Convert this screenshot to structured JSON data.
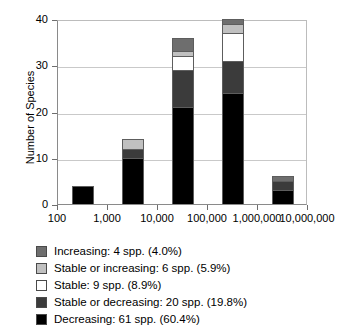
{
  "chart_data": {
    "type": "bar",
    "title": "",
    "subtitle": "",
    "xlabel": "",
    "ylabel": "Number of Species",
    "stacked": true,
    "grid": true,
    "legend_position": "below",
    "xscale": "log",
    "xlim": [
      100,
      10000000
    ],
    "ylim": [
      0,
      40
    ],
    "ytick_values": [
      0,
      10,
      20,
      30,
      40
    ],
    "ytick_labels": [
      "0",
      "10",
      "20",
      "30",
      "40"
    ],
    "xtick_values": [
      100,
      1000,
      10000,
      100000,
      1000000,
      10000000
    ],
    "xtick_labels": [
      "100",
      "1,000",
      "10,000",
      "100,000",
      "1,000,000",
      "10,000,000"
    ],
    "categories": [
      "100-1,000",
      "1,000-10,000",
      "10,000-100,000",
      "100,000-1,000,000",
      "1,000,000-10,000,000"
    ],
    "bar_totals": [
      4,
      14,
      36,
      40,
      6
    ],
    "series": [
      {
        "name": "Decreasing",
        "color": "#000000",
        "legend_label": "Decreasing: 61 spp. (60.4%)",
        "count": 61,
        "percent": "60.4%",
        "values": [
          4,
          10,
          21,
          24,
          3
        ]
      },
      {
        "name": "Stable or decreasing",
        "color": "#3b3b3b",
        "legend_label": "Stable or decreasing: 20 spp. (19.8%)",
        "count": 20,
        "percent": "19.8%",
        "values": [
          0,
          2,
          8,
          7,
          2
        ]
      },
      {
        "name": "Stable",
        "color": "#ffffff",
        "legend_label": "Stable: 9 spp. (8.9%)",
        "count": 9,
        "percent": "8.9%",
        "values": [
          0,
          0,
          3,
          6,
          0
        ]
      },
      {
        "name": "Stable or increasing",
        "color": "#c0c0c0",
        "legend_label": "Stable or increasing: 6 spp. (5.9%)",
        "count": 6,
        "percent": "5.9%",
        "values": [
          0,
          2,
          1,
          2,
          0
        ]
      },
      {
        "name": "Increasing",
        "color": "#6e6e6e",
        "legend_label": "Increasing: 4 spp. (4.0%)",
        "count": 4,
        "percent": "4.0%",
        "values": [
          0,
          0,
          3,
          1,
          1
        ]
      }
    ]
  },
  "axes": {
    "y_title": "Number of Species",
    "y_ticks": [
      {
        "label": "40"
      },
      {
        "label": "30"
      },
      {
        "label": "20"
      },
      {
        "label": "10"
      },
      {
        "label": "0"
      }
    ],
    "x_ticks": [
      {
        "label": "100"
      },
      {
        "label": "1,000"
      },
      {
        "label": "10,000"
      },
      {
        "label": "100,000"
      },
      {
        "label": "1,000,000"
      },
      {
        "label": "10,000,000"
      }
    ]
  },
  "legend": {
    "items": [
      {
        "label": "Increasing: 4 spp. (4.0%)",
        "color": "#6e6e6e",
        "swatch_name": "increasing"
      },
      {
        "label": "Stable or increasing: 6 spp. (5.9%)",
        "color": "#c0c0c0",
        "swatch_name": "stable-or-increasing"
      },
      {
        "label": "Stable: 9 spp. (8.9%)",
        "color": "#ffffff",
        "swatch_name": "stable"
      },
      {
        "label": "Stable or decreasing: 20 spp. (19.8%)",
        "color": "#3b3b3b",
        "swatch_name": "stable-or-decreasing"
      },
      {
        "label": "Decreasing: 61 spp. (60.4%)",
        "color": "#000000",
        "swatch_name": "decreasing"
      }
    ]
  }
}
